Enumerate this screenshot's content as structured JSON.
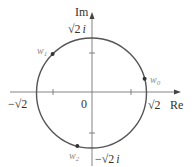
{
  "diagram": {
    "axes": {
      "real_label": "Re",
      "imag_label": "Im",
      "origin_label": "0"
    },
    "circle": {
      "radius_label": "√2",
      "color": "#555555"
    },
    "intercepts": {
      "pos_real": "√2",
      "neg_real": "−√2",
      "pos_imag": "√2 i",
      "neg_imag": "−√2 i"
    },
    "points": [
      {
        "name": "w0",
        "base": "w",
        "sub": "0",
        "angle_deg": 15
      },
      {
        "name": "w1",
        "base": "w",
        "sub": "1",
        "angle_deg": 135
      },
      {
        "name": "w2",
        "base": "w",
        "sub": "2",
        "angle_deg": 255
      }
    ]
  }
}
